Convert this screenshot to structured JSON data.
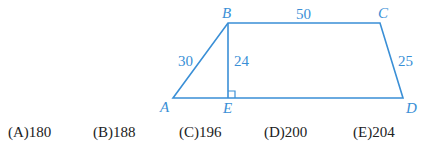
{
  "diagram": {
    "vertices": {
      "A": "A",
      "B": "B",
      "C": "C",
      "D": "D",
      "E": "E"
    },
    "lengths": {
      "AB": "30",
      "BE": "24",
      "BC": "50",
      "CD": "25"
    },
    "stroke_color": "#3a8fd6"
  },
  "choices": [
    {
      "letter": "(A)",
      "value": "180"
    },
    {
      "letter": "(B)",
      "value": "188"
    },
    {
      "letter": "(C)",
      "value": "196"
    },
    {
      "letter": "(D)",
      "value": "200"
    },
    {
      "letter": "(E)",
      "value": "204"
    }
  ]
}
